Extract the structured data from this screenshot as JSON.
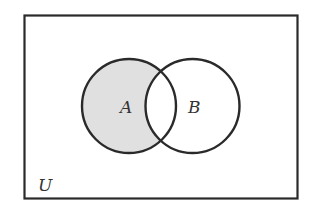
{
  "diagram": {
    "type": "venn",
    "title": "",
    "universe_label": "U",
    "sets": [
      {
        "label": "A"
      },
      {
        "label": "B"
      }
    ],
    "shaded_region": "A minus B",
    "colors": {
      "stroke": "#2a2a2a",
      "shade": "#e0e0e0",
      "background": "#ffffff"
    }
  }
}
